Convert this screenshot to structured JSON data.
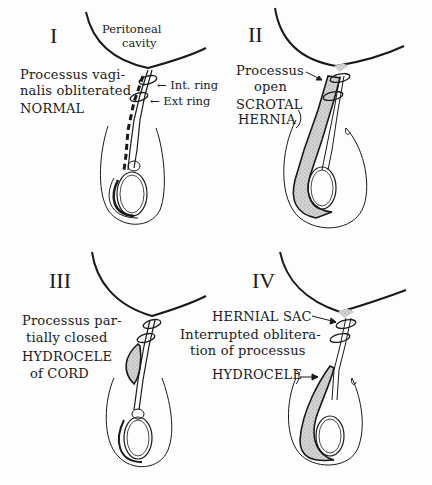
{
  "panels": [
    {
      "numeral": "I",
      "labels": {
        "peritoneal_1": "Peritoneal",
        "peritoneal_2": "cavity",
        "desc_1": "Processus vagi-",
        "desc_2": "nalis obliterated",
        "title": "NORMAL",
        "int_ring": "← Int. ring",
        "ext_ring": "← Ext ring"
      }
    },
    {
      "numeral": "II",
      "labels": {
        "desc_1": "Processus",
        "desc_2": "open",
        "title_1": "SCROTAL",
        "title_2": "HERNIA"
      }
    },
    {
      "numeral": "III",
      "labels": {
        "desc_1": "Processus par-",
        "desc_2": "tially closed",
        "title_1": "HYDROCELE",
        "title_2": "of CORD"
      }
    },
    {
      "numeral": "IV",
      "labels": {
        "sac": "HERNIAL SAC",
        "desc_1": "Interrupted oblitera-",
        "desc_2": "tion of processus",
        "title": "HYDROCELE"
      }
    }
  ],
  "colors": {
    "ink": "#1a1a1a",
    "stipple": "#c8c8c8",
    "background": "#fdfdfd"
  }
}
